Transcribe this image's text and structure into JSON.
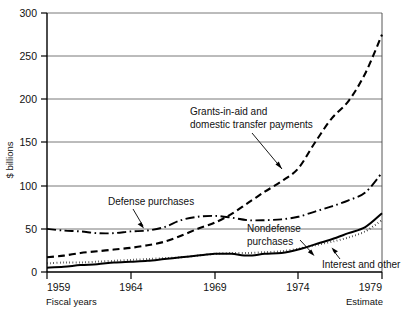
{
  "chart_data": {
    "type": "line",
    "title": "",
    "xlabel": "Fiscal years",
    "ylabel": "$ billions",
    "xlim": [
      1959,
      1979
    ],
    "ylim": [
      0,
      300
    ],
    "grid": true,
    "legend": "none (inline annotations)",
    "x_ticks": [
      "1959",
      "1964",
      "1969",
      "1974",
      "1979"
    ],
    "y_ticks": [
      "0",
      "50",
      "100",
      "150",
      "200",
      "250",
      "300"
    ],
    "x": [
      1959,
      1960,
      1961,
      1962,
      1963,
      1964,
      1965,
      1966,
      1967,
      1968,
      1969,
      1970,
      1971,
      1972,
      1973,
      1974,
      1975,
      1976,
      1977,
      1978,
      1979
    ],
    "series": [
      {
        "name": "Grants-in-aid and domestic transfer payments",
        "style": "dashed",
        "values": [
          17,
          19,
          22,
          24,
          26,
          28,
          31,
          35,
          42,
          50,
          57,
          67,
          80,
          93,
          105,
          120,
          150,
          178,
          198,
          230,
          275
        ]
      },
      {
        "name": "Defense purchases",
        "style": "dash-dot",
        "values": [
          50,
          48,
          47,
          45,
          45,
          47,
          48,
          52,
          60,
          64,
          65,
          63,
          60,
          60,
          61,
          64,
          70,
          76,
          83,
          92,
          115
        ]
      },
      {
        "name": "Nondefense purchases",
        "style": "solid",
        "values": [
          5,
          6,
          8,
          9,
          11,
          12,
          13,
          15,
          17,
          19,
          21,
          21,
          19,
          21,
          22,
          26,
          32,
          38,
          45,
          52,
          68
        ]
      },
      {
        "name": "Interest and other",
        "style": "dotted",
        "values": [
          10,
          11,
          11,
          12,
          13,
          14,
          15,
          16,
          17,
          19,
          21,
          22,
          22,
          23,
          24,
          27,
          31,
          35,
          40,
          47,
          60
        ]
      }
    ],
    "annotations": [
      {
        "id": "grants",
        "lines": [
          "Grants-in-aid and",
          "domestic transfer payments"
        ],
        "pointer": "leader-line-down-right"
      },
      {
        "id": "defense",
        "lines": [
          "Defense purchases"
        ],
        "pointer": "arrow-down-right"
      },
      {
        "id": "nondefense",
        "lines": [
          "Nondefense",
          "purchases"
        ],
        "pointer": "arrow-down-right"
      },
      {
        "id": "interest",
        "lines": [
          "Interest and other"
        ],
        "pointer": "arrow-up-right"
      }
    ],
    "footnotes": {
      "left": "Fiscal years",
      "right": "Estimate"
    }
  }
}
